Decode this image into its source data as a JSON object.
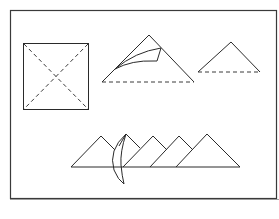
{
  "figure": {
    "frame": {
      "x": 10,
      "y": 10,
      "width": 267,
      "height": 189
    },
    "colors": {
      "line": "#2a2a2a",
      "background": "#ffffff"
    },
    "steps": [
      {
        "name": "square-with-diagonals",
        "shape": "square",
        "fold_lines": "dashed diagonals"
      },
      {
        "name": "triangle-with-curl",
        "shape": "triangle",
        "base": "dashed",
        "detail": "curled corner flap"
      },
      {
        "name": "small-triangle",
        "shape": "triangle",
        "base": "dashed"
      },
      {
        "name": "pyramid-row",
        "shape": "five overlapping triangles",
        "detail": "curved flap crossing second triangle"
      }
    ]
  }
}
